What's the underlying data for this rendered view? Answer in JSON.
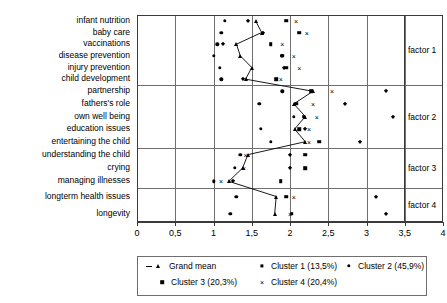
{
  "chart_data": {
    "type": "scatter",
    "title": "",
    "xlabel": "",
    "ylabel": "",
    "xlim": [
      0,
      4
    ],
    "xticks": [
      0,
      0.5,
      1,
      1.5,
      2,
      2.5,
      3,
      3.5,
      4
    ],
    "xticklabels": [
      "0",
      "0,5",
      "1",
      "1,5",
      "2",
      "2,5",
      "3",
      "3,5",
      "4"
    ],
    "grid": true,
    "legend_position": "below",
    "categories": [
      "infant nutrition",
      "baby care",
      "vaccinations",
      "disease prevention",
      "injury prevention",
      "child development",
      "partnership",
      "fathers's role",
      "own well being",
      "education issues",
      "entertaining the child",
      "understanding the child",
      "crying",
      "managing illnesses",
      "longterm health issues",
      "longevity"
    ],
    "groups": [
      {
        "label": "factor 1",
        "categories": [
          "infant nutrition",
          "baby care",
          "vaccinations",
          "disease prevention",
          "injury prevention",
          "child development"
        ]
      },
      {
        "label": "factor 2",
        "categories": [
          "partnership",
          "fathers's role",
          "own well being",
          "education issues",
          "entertaining the child"
        ]
      },
      {
        "label": "factor 3",
        "categories": [
          "understanding the child",
          "crying",
          "managing illnesses"
        ]
      },
      {
        "label": "factor 4",
        "categories": [
          "longterm health issues",
          "longevity"
        ]
      }
    ],
    "series": [
      {
        "name": "Grand mean",
        "marker": "triangle",
        "line": true,
        "values": [
          1.55,
          1.63,
          1.3,
          1.35,
          1.5,
          1.42,
          2.3,
          2.05,
          2.2,
          2.06,
          2.2,
          1.45,
          1.38,
          1.2,
          1.82,
          1.8
        ]
      },
      {
        "name": "Cluster 1 (13,5%)",
        "marker": "diamond",
        "line": false,
        "values": [
          1.45,
          1.65,
          1.12,
          1.9,
          1.92,
          1.38,
          3.25,
          2.72,
          3.35,
          2.2,
          2.92,
          2.0,
          2.0,
          1.25,
          3.12,
          3.25
        ]
      },
      {
        "name": "Cluster 2 (45,9%)",
        "marker": "circle",
        "line": false,
        "values": [
          1.15,
          1.1,
          1.05,
          1.0,
          1.08,
          1.1,
          1.9,
          1.6,
          2.05,
          1.62,
          1.75,
          1.35,
          1.28,
          1.0,
          1.3,
          1.22
        ]
      },
      {
        "name": "Cluster 3 (20,3%)",
        "marker": "square",
        "line": false,
        "values": [
          1.95,
          2.12,
          1.75,
          1.9,
          1.95,
          1.82,
          2.28,
          2.08,
          2.18,
          2.12,
          2.38,
          2.2,
          2.2,
          1.88,
          1.95,
          2.02
        ]
      },
      {
        "name": "Cluster 4 (20,4%)",
        "marker": "cross",
        "line": false,
        "values": [
          2.08,
          2.22,
          1.9,
          2.05,
          2.12,
          1.88,
          2.55,
          2.3,
          2.35,
          2.25,
          2.25,
          1.42,
          1.4,
          1.1,
          2.05,
          2.0
        ]
      }
    ]
  },
  "legend": {
    "entries": [
      {
        "label": "Grand mean",
        "marker": "dash-triangle"
      },
      {
        "label": "Cluster 1 (13,5%)",
        "marker": "diamond"
      },
      {
        "label": "Cluster 2 (45,9%)",
        "marker": "circle"
      },
      {
        "label": "Cluster 3 (20,3%)",
        "marker": "square"
      },
      {
        "label": "Cluster 4 (20,4%)",
        "marker": "cross"
      }
    ]
  },
  "colors": {
    "marker": "#000000",
    "grid": "#6f6f6f",
    "frame": "#3a3a3a",
    "background": "#ffffff"
  }
}
